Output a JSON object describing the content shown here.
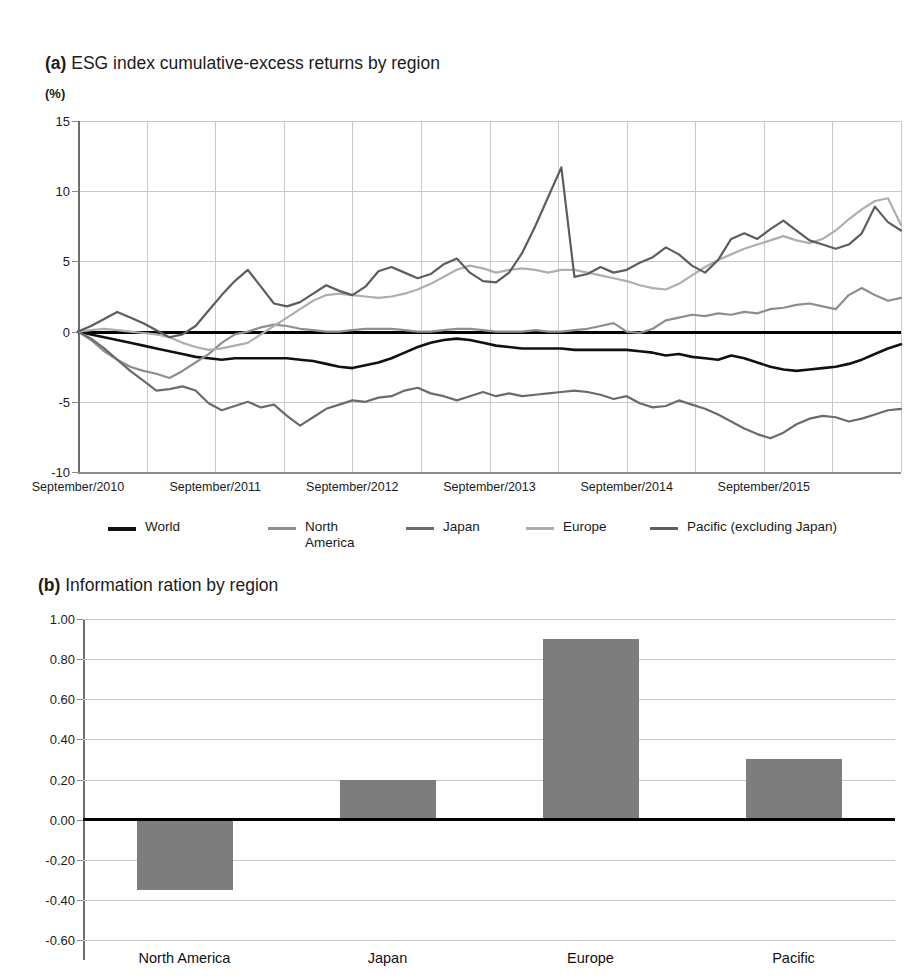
{
  "top_strip_text": "",
  "panel_a": {
    "label": "(a)",
    "title": "ESG index cumulative-excess returns by region",
    "unit": "(%)"
  },
  "panel_b": {
    "label": "(b)",
    "title": "Information ration by region"
  },
  "legend": {
    "items": [
      {
        "name": "World",
        "color": "#111111",
        "width": 4
      },
      {
        "name": "North\nAmerica",
        "color": "#8e8e8e",
        "width": 2.6
      },
      {
        "name": "Japan",
        "color": "#6b6b6b",
        "width": 2.6
      },
      {
        "name": "Europe",
        "color": "#aeaeae",
        "width": 2.6
      },
      {
        "name": "Pacific (excluding Japan)",
        "color": "#5d5d5d",
        "width": 2.6
      }
    ]
  },
  "chart_data": [
    {
      "type": "line",
      "title": "ESG index cumulative-excess returns by region",
      "xlabel": "",
      "ylabel": "(%)",
      "ylim": [
        -10,
        15
      ],
      "yticks": [
        15,
        10,
        5,
        0,
        -5,
        -10
      ],
      "ytick_labels": [
        "15",
        "10",
        "5",
        "0",
        "-5",
        "-10"
      ],
      "xtick_labels": [
        "September/2010",
        "September/2011",
        "September/2012",
        "September/2013",
        "September/2014",
        "September/2015"
      ],
      "grid": true,
      "legend_position": "bottom",
      "x_count": 64,
      "series": [
        {
          "name": "World",
          "color": "#111111",
          "width": 2.6,
          "values": [
            0.0,
            -0.2,
            -0.4,
            -0.6,
            -0.8,
            -1.0,
            -1.2,
            -1.4,
            -1.6,
            -1.8,
            -1.9,
            -2.0,
            -1.9,
            -1.9,
            -1.9,
            -1.9,
            -1.9,
            -2.0,
            -2.1,
            -2.3,
            -2.5,
            -2.6,
            -2.4,
            -2.2,
            -1.9,
            -1.5,
            -1.1,
            -0.8,
            -0.6,
            -0.5,
            -0.6,
            -0.8,
            -1.0,
            -1.1,
            -1.2,
            -1.2,
            -1.2,
            -1.2,
            -1.3,
            -1.3,
            -1.3,
            -1.3,
            -1.3,
            -1.4,
            -1.5,
            -1.7,
            -1.6,
            -1.8,
            -1.9,
            -2.0,
            -1.7,
            -1.9,
            -2.2,
            -2.5,
            -2.7,
            -2.8,
            -2.7,
            -2.6,
            -2.5,
            -2.3,
            -2.0,
            -1.6,
            -1.2,
            -0.9
          ]
        },
        {
          "name": "North America",
          "color": "#8e8e8e",
          "width": 2.2,
          "values": [
            0.0,
            -0.6,
            -1.4,
            -2.0,
            -2.5,
            -2.8,
            -3.0,
            -3.3,
            -2.8,
            -2.2,
            -1.6,
            -0.8,
            -0.2,
            0.0,
            0.3,
            0.5,
            0.4,
            0.2,
            0.1,
            0.0,
            0.0,
            0.1,
            0.2,
            0.2,
            0.2,
            0.1,
            0.0,
            0.0,
            0.1,
            0.2,
            0.2,
            0.1,
            0.0,
            0.0,
            0.0,
            0.1,
            0.0,
            0.0,
            0.1,
            0.2,
            0.4,
            0.6,
            0.0,
            -0.1,
            0.2,
            0.8,
            1.0,
            1.2,
            1.1,
            1.3,
            1.2,
            1.4,
            1.3,
            1.6,
            1.7,
            1.9,
            2.0,
            1.8,
            1.6,
            2.6,
            3.1,
            2.6,
            2.2,
            2.4
          ]
        },
        {
          "name": "Japan",
          "color": "#6b6b6b",
          "width": 2.2,
          "values": [
            0.0,
            -0.5,
            -1.2,
            -2.0,
            -2.8,
            -3.5,
            -4.2,
            -4.1,
            -3.9,
            -4.2,
            -5.1,
            -5.6,
            -5.3,
            -5.0,
            -5.4,
            -5.2,
            -6.0,
            -6.7,
            -6.1,
            -5.5,
            -5.2,
            -4.9,
            -5.0,
            -4.7,
            -4.6,
            -4.2,
            -4.0,
            -4.4,
            -4.6,
            -4.9,
            -4.6,
            -4.3,
            -4.6,
            -4.4,
            -4.6,
            -4.5,
            -4.4,
            -4.3,
            -4.2,
            -4.3,
            -4.5,
            -4.8,
            -4.6,
            -5.1,
            -5.4,
            -5.3,
            -4.9,
            -5.2,
            -5.5,
            -5.9,
            -6.4,
            -6.9,
            -7.3,
            -7.6,
            -7.2,
            -6.6,
            -6.2,
            -6.0,
            -6.1,
            -6.4,
            -6.2,
            -5.9,
            -5.6,
            -5.5
          ]
        },
        {
          "name": "Europe",
          "color": "#aeaeae",
          "width": 2.2,
          "values": [
            0.0,
            0.1,
            0.2,
            0.1,
            0.0,
            -0.1,
            -0.2,
            -0.4,
            -0.8,
            -1.1,
            -1.3,
            -1.2,
            -1.0,
            -0.8,
            -0.2,
            0.4,
            1.0,
            1.6,
            2.2,
            2.6,
            2.7,
            2.6,
            2.5,
            2.4,
            2.5,
            2.7,
            3.0,
            3.4,
            3.9,
            4.4,
            4.7,
            4.5,
            4.2,
            4.4,
            4.5,
            4.4,
            4.2,
            4.4,
            4.4,
            4.2,
            4.0,
            3.8,
            3.6,
            3.3,
            3.1,
            3.0,
            3.4,
            4.0,
            4.6,
            5.1,
            5.5,
            5.9,
            6.2,
            6.5,
            6.8,
            6.5,
            6.3,
            6.6,
            7.2,
            8.0,
            8.7,
            9.3,
            9.5,
            7.6
          ]
        },
        {
          "name": "Pacific (excluding Japan)",
          "color": "#5d5d5d",
          "width": 2.2,
          "values": [
            0.0,
            0.4,
            0.9,
            1.4,
            1.0,
            0.6,
            0.1,
            -0.4,
            -0.2,
            0.4,
            1.5,
            2.6,
            3.6,
            4.4,
            3.2,
            2.0,
            1.8,
            2.1,
            2.7,
            3.3,
            2.9,
            2.6,
            3.2,
            4.3,
            4.6,
            4.2,
            3.8,
            4.1,
            4.8,
            5.2,
            4.2,
            3.6,
            3.5,
            4.2,
            5.6,
            7.5,
            9.6,
            11.7,
            3.9,
            4.1,
            4.6,
            4.2,
            4.4,
            4.9,
            5.3,
            6.0,
            5.5,
            4.7,
            4.2,
            5.1,
            6.6,
            7.0,
            6.6,
            7.3,
            7.9,
            7.2,
            6.5,
            6.2,
            5.9,
            6.2,
            7.0,
            8.9,
            7.8,
            7.2
          ]
        }
      ]
    },
    {
      "type": "bar",
      "title": "Information ration by region",
      "xlabel": "",
      "ylabel": "",
      "ylim": [
        -0.6,
        1.0
      ],
      "yticks": [
        1.0,
        0.8,
        0.6,
        0.4,
        0.2,
        0.0,
        -0.2,
        -0.4,
        -0.6
      ],
      "ytick_labels": [
        "1.00",
        "0.80",
        "0.60",
        "0.40",
        "0.20",
        "0.00",
        "-0.20",
        "-0.40",
        "-0.60"
      ],
      "categories": [
        "North America",
        "Japan",
        "Europe",
        "Pacific"
      ],
      "values": [
        -0.35,
        0.2,
        0.9,
        0.3
      ],
      "bar_color": "#7d7d7d",
      "grid": true
    }
  ]
}
